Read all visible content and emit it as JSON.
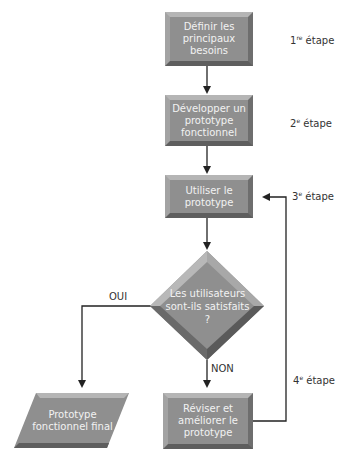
{
  "diagram": {
    "type": "flowchart",
    "nodes": [
      {
        "id": "n1",
        "shape": "rectangle",
        "label": "Définir les principaux besoins",
        "lines": [
          "Définir les",
          "principaux",
          "besoins"
        ]
      },
      {
        "id": "n2",
        "shape": "rectangle",
        "label": "Développer un prototype fonctionnel",
        "lines": [
          "Développer",
          "un prototype",
          "fonctionnel"
        ]
      },
      {
        "id": "n3",
        "shape": "rectangle",
        "label": "Utiliser le prototype",
        "lines": [
          "Utiliser le",
          "prototype"
        ]
      },
      {
        "id": "n4",
        "shape": "diamond",
        "label": "Les utilisateurs sont-ils satisfaits ?",
        "lines": [
          "Les utilisateurs",
          "sont-ils",
          "satisfaits ?"
        ]
      },
      {
        "id": "n5",
        "shape": "parallelogram",
        "label": "Prototype fonctionnel final",
        "lines": [
          "Prototype",
          "fonctionnel final"
        ]
      },
      {
        "id": "n6",
        "shape": "rectangle",
        "label": "Réviser et améliorer le prototype",
        "lines": [
          "Réviser",
          "et améliorer",
          "le prototype"
        ]
      }
    ],
    "edges": [
      {
        "from": "n1",
        "to": "n2",
        "label": ""
      },
      {
        "from": "n2",
        "to": "n3",
        "label": ""
      },
      {
        "from": "n3",
        "to": "n4",
        "label": ""
      },
      {
        "from": "n4",
        "to": "n5",
        "label": "OUI"
      },
      {
        "from": "n4",
        "to": "n6",
        "label": "NON"
      },
      {
        "from": "n6",
        "to": "n3",
        "label": ""
      }
    ],
    "steps": [
      {
        "num": "1",
        "sup": "re",
        "text": "étape"
      },
      {
        "num": "2",
        "sup": "e",
        "text": "étape"
      },
      {
        "num": "3",
        "sup": "e",
        "text": "étape"
      },
      {
        "num": "4",
        "sup": "e",
        "text": "étape"
      }
    ],
    "edge_labels": {
      "yes": "OUI",
      "no": "NON"
    },
    "colors": {
      "box": "#8f8f8f",
      "text": "#f2f2f2",
      "line": "#222222"
    }
  }
}
